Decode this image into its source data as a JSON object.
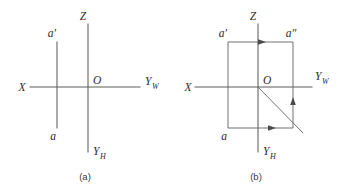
{
  "figure": {
    "stroke_color": "#5d5d5d",
    "background_color": "#ffffff"
  },
  "panel_a": {
    "caption": "(a)",
    "labels": {
      "z_axis": "Z",
      "x_axis": "X",
      "origin": "O",
      "yw_axis": "Y",
      "yw_sub": "W",
      "yh_axis": "Y",
      "yh_sub": "H",
      "point_front": "a′",
      "point_top": "a"
    }
  },
  "panel_b": {
    "caption": "(b)",
    "labels": {
      "z_axis": "Z",
      "x_axis": "X",
      "origin": "O",
      "yw_axis": "Y",
      "yw_sub": "W",
      "yh_axis": "Y",
      "yh_sub": "H",
      "point_front": "a′",
      "point_side": "a″",
      "point_top": "a"
    }
  }
}
